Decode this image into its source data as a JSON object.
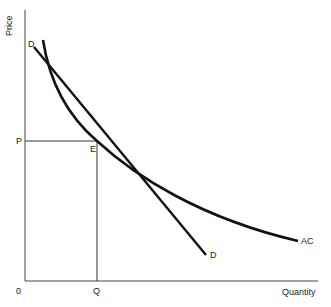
{
  "diagram": {
    "type": "economics-average-cost-demand-tangency",
    "axes": {
      "y_label": "Price",
      "x_label": "Quantity",
      "origin_label": "0"
    },
    "curves": [
      {
        "name": "demand",
        "label_start": "D",
        "label_end": "D"
      },
      {
        "name": "average-cost",
        "label": "AC"
      }
    ],
    "points": {
      "price_label": "P",
      "quantity_label": "Q",
      "equilibrium_label": "E"
    },
    "colors": {
      "line": "#111111",
      "guide": "#333333",
      "text": "#222222",
      "background": "#ffffff"
    }
  }
}
